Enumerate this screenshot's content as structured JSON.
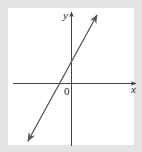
{
  "diagram": {
    "type": "coordinate-graph",
    "axes": {
      "x_label": "x",
      "y_label": "y",
      "origin_label": "0"
    },
    "line": {
      "description": "straight line with positive slope",
      "x_intercept": "negative",
      "y_intercept": "positive",
      "arrows": "both ends"
    },
    "colors": {
      "background": "#e4e4e4",
      "panel": "#ffffff",
      "axis": "#444444",
      "line": "#555555"
    }
  }
}
